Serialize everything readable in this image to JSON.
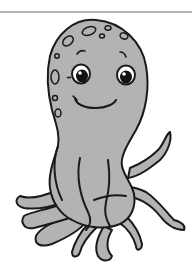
{
  "image": {
    "subject": "cartoon octopus clip art",
    "alt": "Smiling grey cartoon octopus with spots on its head and curling tentacles",
    "colors": {
      "body": "#b3b3b3",
      "outline": "#1a1a1a",
      "background": "#ffffff",
      "rule": "#b4b4b4",
      "eye_white": "#ffffff",
      "pupil": "#111111"
    }
  }
}
